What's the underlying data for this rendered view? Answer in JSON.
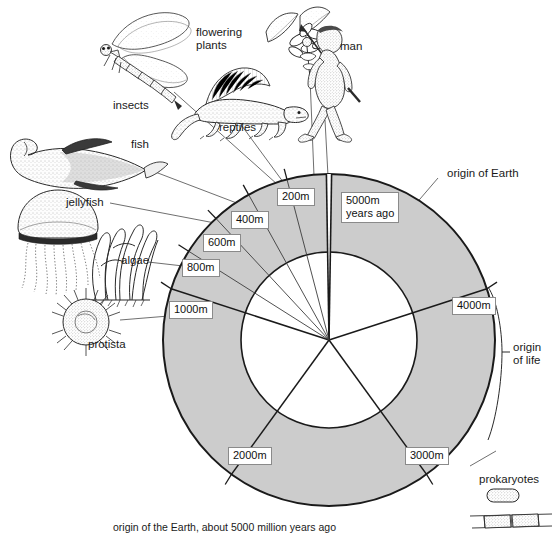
{
  "figure": {
    "type": "geological-time-clock-diagram",
    "caption": "origin of the Earth, about 5000 million years ago"
  },
  "ring": {
    "segments": [
      {
        "label": "5000m\nyears ago",
        "value": 5000,
        "unit": "million years ago"
      },
      {
        "label": "4000m",
        "value": 4000,
        "unit": "million years ago"
      },
      {
        "label": "3000m",
        "value": 3000,
        "unit": "million years ago"
      },
      {
        "label": "2000m",
        "value": 2000,
        "unit": "million years ago"
      },
      {
        "label": "1000m",
        "value": 1000,
        "unit": "million years ago"
      },
      {
        "label": "800m",
        "value": 800,
        "unit": "million years ago"
      },
      {
        "label": "600m",
        "value": 600,
        "unit": "million years ago"
      },
      {
        "label": "400m",
        "value": 400,
        "unit": "million years ago"
      },
      {
        "label": "200m",
        "value": 200,
        "unit": "million years ago"
      }
    ],
    "fill_color": "#cccccc",
    "stroke_color": "#1a1a1a"
  },
  "organisms": [
    {
      "name": "insects",
      "icon": "dragonfly-illustration"
    },
    {
      "name": "flowering\nplants",
      "icon": "flowering-plant-illustration"
    },
    {
      "name": "man",
      "icon": "man-illustration"
    },
    {
      "name": "reptiles",
      "icon": "reptile-illustration"
    },
    {
      "name": "fish",
      "icon": "fish-illustration"
    },
    {
      "name": "jellyfish",
      "icon": "jellyfish-illustration"
    },
    {
      "name": "algae",
      "icon": "algae-illustration"
    },
    {
      "name": "protista",
      "icon": "protista-illustration"
    },
    {
      "name": "prokaryotes",
      "icon": "prokaryote-illustration"
    }
  ],
  "annotations": {
    "origin_of_earth": "origin of Earth",
    "origin_of_life": "origin\nof life"
  }
}
